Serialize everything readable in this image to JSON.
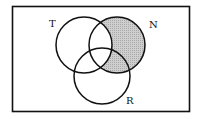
{
  "diagram": {
    "type": "venn",
    "sets": [
      {
        "id": "T",
        "label": "T"
      },
      {
        "id": "N",
        "label": "N"
      },
      {
        "id": "R",
        "label": "R"
      }
    ],
    "shaded_region": "N minus T",
    "shade_color": "#c8c8c8",
    "line_color": "#111111"
  }
}
